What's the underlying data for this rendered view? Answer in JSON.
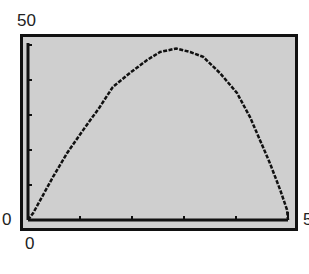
{
  "chart_data": {
    "type": "line",
    "title": "",
    "xlabel": "",
    "ylabel": "",
    "xlim": [
      0,
      5
    ],
    "ylim": [
      0,
      50
    ],
    "x_ticks": [
      0,
      1,
      2,
      3,
      4,
      5
    ],
    "y_ticks": [
      0,
      10,
      20,
      30,
      40,
      50
    ],
    "grid": false,
    "legend": null,
    "labels": {
      "ymax": "50",
      "ymin": "0",
      "xmin": "0",
      "xmax": "5"
    },
    "series": [
      {
        "name": "curve",
        "x": [
          0,
          0.1,
          0.48,
          0.75,
          1.06,
          1.38,
          1.63,
          1.96,
          2.29,
          2.54,
          2.85,
          3.12,
          3.37,
          3.69,
          4.02,
          4.27,
          4.46,
          4.65,
          4.85,
          4.98,
          5.0
        ],
        "y": [
          0,
          2,
          12.3,
          19.1,
          25.7,
          32.3,
          38,
          42,
          45.7,
          48,
          49,
          48,
          46.6,
          42,
          36.3,
          29.4,
          22.9,
          16.3,
          8.6,
          2.9,
          0
        ]
      }
    ],
    "colors": {
      "background": "#cfcfcf",
      "frame": "#111111",
      "curve": "#111111"
    }
  }
}
